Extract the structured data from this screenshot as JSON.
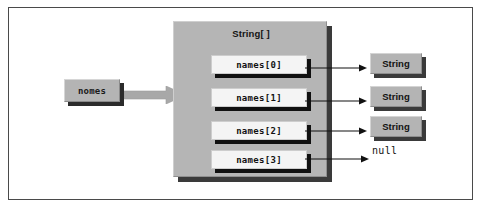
{
  "figure": {
    "variable": {
      "label": "nomes"
    },
    "array": {
      "type_label": "String[ ]",
      "cells": [
        {
          "label": "names[0]",
          "target": "String"
        },
        {
          "label": "names[1]",
          "target": "String"
        },
        {
          "label": "names[2]",
          "target": "String"
        },
        {
          "label": "names[3]",
          "target": "null"
        }
      ]
    },
    "objects": [
      {
        "label": "String"
      },
      {
        "label": "String"
      },
      {
        "label": "String"
      }
    ],
    "null_value": {
      "label": "null"
    },
    "colors": {
      "box_gray": "#b4b4b4",
      "container_gray": "#b5b5b5",
      "cell_white": "#f4f4f4",
      "shadow_dark": "#2b2b2b",
      "arrow_gray": "#a8a8a8",
      "line_black": "#111111",
      "frame_border": "#4a4a4a",
      "page_background": "#ffffff"
    }
  }
}
